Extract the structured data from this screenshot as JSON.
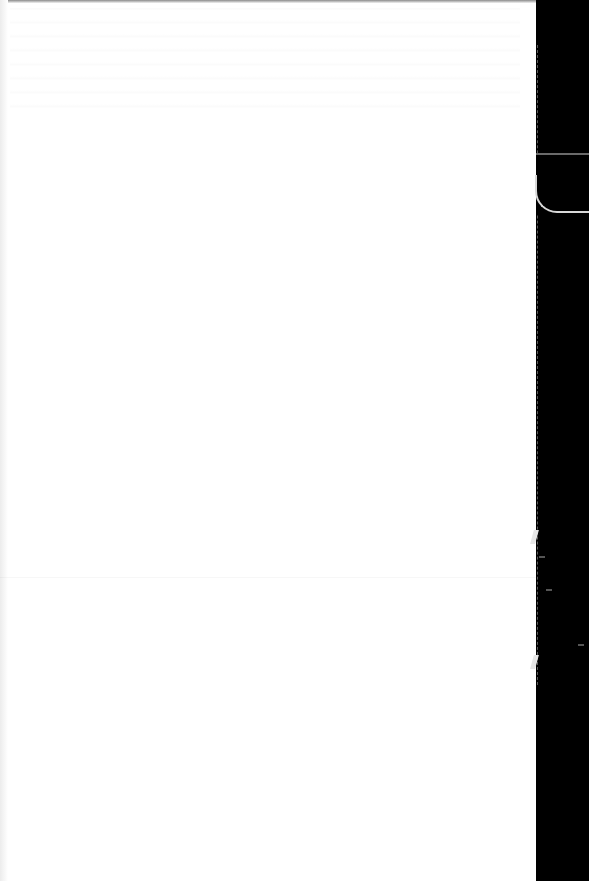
{
  "document": {
    "type": "scanned-page",
    "text": "",
    "colors": {
      "paper": "#ffffff",
      "background": "#000000",
      "edge": "#d8d8d8"
    }
  }
}
